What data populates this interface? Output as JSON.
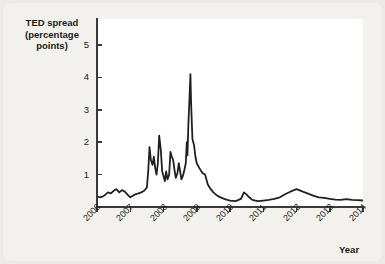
{
  "figure": {
    "y_axis_title_lines": [
      "TED spread",
      "(percentage",
      "points)"
    ],
    "x_axis_title": "Year",
    "line_color": "#231f20",
    "plot_background": "#ffffff",
    "page_background": "#eceae6"
  },
  "chart_data": {
    "type": "line",
    "title": "TED spread (percentage points)",
    "xlabel": "Year",
    "ylabel": "TED spread (percentage points)",
    "xlim": [
      2006.0,
      2014.0
    ],
    "ylim": [
      0,
      5.8
    ],
    "xticks": [
      2006,
      2007,
      2008,
      2009,
      2010,
      2011,
      2012,
      2013,
      2014
    ],
    "xtick_labels": [
      "2006",
      "2007",
      "2008",
      "2009",
      "2010",
      "2011",
      "2012",
      "2013",
      "2014"
    ],
    "yticks": [
      1,
      2,
      3,
      4,
      5
    ],
    "ytick_labels": [
      "1",
      "2",
      "3",
      "4",
      "5"
    ],
    "grid": false,
    "legend": "none",
    "series": [
      {
        "name": "TED spread",
        "x": [
          2006.0,
          2006.08,
          2006.17,
          2006.25,
          2006.33,
          2006.42,
          2006.5,
          2006.58,
          2006.67,
          2006.75,
          2006.83,
          2006.92,
          2007.0,
          2007.08,
          2007.17,
          2007.25,
          2007.33,
          2007.42,
          2007.5,
          2007.54,
          2007.58,
          2007.62,
          2007.67,
          2007.71,
          2007.75,
          2007.79,
          2007.83,
          2007.87,
          2007.92,
          2007.96,
          2008.0,
          2008.04,
          2008.08,
          2008.12,
          2008.17,
          2008.21,
          2008.25,
          2008.29,
          2008.33,
          2008.37,
          2008.42,
          2008.46,
          2008.5,
          2008.54,
          2008.58,
          2008.62,
          2008.67,
          2008.7,
          2008.72,
          2008.75,
          2008.78,
          2008.81,
          2008.83,
          2008.87,
          2008.92,
          2008.96,
          2009.0,
          2009.08,
          2009.17,
          2009.25,
          2009.33,
          2009.42,
          2009.5,
          2009.58,
          2009.67,
          2009.75,
          2009.83,
          2009.92,
          2010.0,
          2010.17,
          2010.33,
          2010.42,
          2010.5,
          2010.58,
          2010.67,
          2010.83,
          2011.0,
          2011.17,
          2011.33,
          2011.5,
          2011.67,
          2011.83,
          2012.0,
          2012.08,
          2012.17,
          2012.33,
          2012.5,
          2012.67,
          2012.83,
          2013.0,
          2013.17,
          2013.33,
          2013.5,
          2013.67,
          2013.83,
          2014.0
        ],
        "y": [
          0.33,
          0.3,
          0.32,
          0.38,
          0.45,
          0.42,
          0.5,
          0.55,
          0.45,
          0.52,
          0.48,
          0.38,
          0.3,
          0.35,
          0.4,
          0.42,
          0.45,
          0.5,
          0.6,
          1.1,
          1.85,
          1.45,
          1.3,
          1.55,
          1.2,
          1.0,
          1.35,
          2.2,
          1.75,
          1.1,
          0.95,
          0.8,
          1.1,
          0.85,
          1.0,
          1.7,
          1.55,
          1.45,
          1.15,
          0.9,
          1.05,
          1.35,
          1.1,
          0.85,
          0.95,
          1.1,
          1.35,
          2.0,
          1.6,
          2.6,
          3.3,
          4.1,
          3.2,
          2.1,
          1.9,
          1.55,
          1.35,
          1.2,
          1.05,
          1.0,
          0.7,
          0.55,
          0.45,
          0.38,
          0.32,
          0.28,
          0.25,
          0.22,
          0.2,
          0.18,
          0.25,
          0.45,
          0.38,
          0.3,
          0.22,
          0.18,
          0.2,
          0.22,
          0.25,
          0.3,
          0.4,
          0.48,
          0.55,
          0.52,
          0.48,
          0.42,
          0.35,
          0.3,
          0.28,
          0.25,
          0.23,
          0.22,
          0.24,
          0.22,
          0.21,
          0.2
        ]
      }
    ]
  },
  "axes": {
    "y_ticks": [
      {
        "label": "1",
        "value": 1
      },
      {
        "label": "2",
        "value": 2
      },
      {
        "label": "3",
        "value": 3
      },
      {
        "label": "4",
        "value": 4
      },
      {
        "label": "5",
        "value": 5
      }
    ],
    "x_ticks": [
      {
        "label": "2006",
        "value": 2006
      },
      {
        "label": "2007",
        "value": 2007
      },
      {
        "label": "2008",
        "value": 2008
      },
      {
        "label": "2009",
        "value": 2009
      },
      {
        "label": "2010",
        "value": 2010
      },
      {
        "label": "2011",
        "value": 2011
      },
      {
        "label": "2012",
        "value": 2012
      },
      {
        "label": "2013",
        "value": 2013
      },
      {
        "label": "2014",
        "value": 2014
      }
    ]
  }
}
